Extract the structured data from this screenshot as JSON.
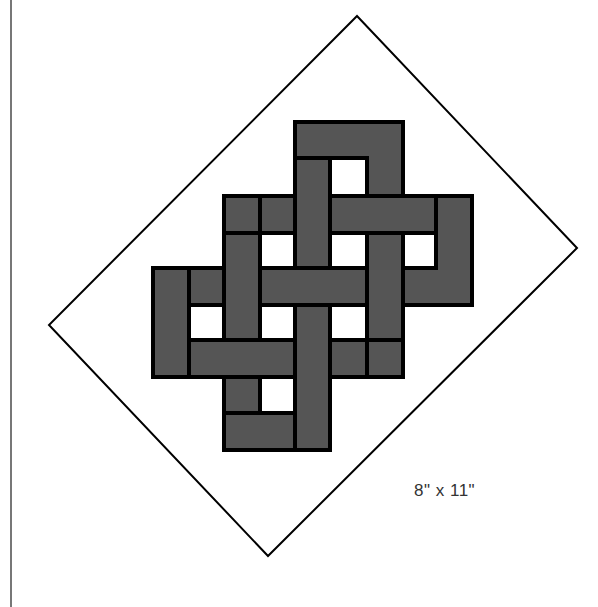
{
  "diagram": {
    "label": "8\" x 11\"",
    "colors": {
      "band_fill": "#555555",
      "band_outline": "#000000",
      "background": "#ffffff",
      "diamond_outline": "#000000",
      "margin_line": "#777777"
    },
    "diamond": {
      "top": [
        357,
        16
      ],
      "right": [
        577,
        248
      ],
      "bottom": [
        268,
        556
      ],
      "left": [
        49,
        325
      ]
    },
    "knot": {
      "description": "Endless knot with interlaced bands forming 8 white square holes",
      "holes": 8
    }
  }
}
